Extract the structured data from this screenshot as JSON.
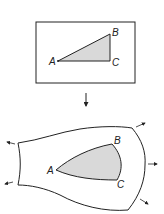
{
  "diagram": {
    "type": "deformation-illustration",
    "top_panel": {
      "description": "Undeformed body (rectangle) with inscribed right triangle",
      "vertices": {
        "A": "A",
        "B": "B",
        "C": "C"
      }
    },
    "transition_arrow": "down-arrow",
    "bottom_panel": {
      "description": "Deformed body with distorted triangle; arrows indicate outward stretching",
      "vertices": {
        "A": "A",
        "B": "B",
        "C": "C"
      },
      "force_arrows": [
        "upper-left",
        "lower-left",
        "upper-right",
        "right",
        "lower-right"
      ]
    },
    "colors": {
      "stroke": "#222222",
      "fill": "#d9d9d9",
      "background": "#ffffff"
    }
  }
}
